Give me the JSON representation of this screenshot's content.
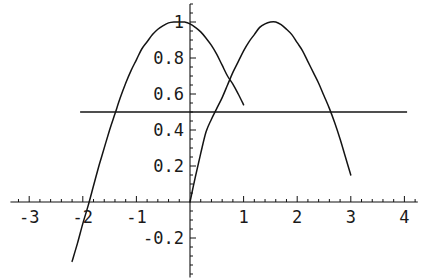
{
  "chart_data": {
    "type": "line",
    "title": "",
    "xlabel": "",
    "ylabel": "",
    "xlim": [
      -3.35,
      4.25
    ],
    "ylim": [
      -0.42,
      1.1
    ],
    "grid": false,
    "legend": "none",
    "axes": {
      "x_axis_value": 0,
      "y_axis_value": 0,
      "x_ticks_major": [
        -3,
        -2,
        -1,
        1,
        2,
        3,
        4
      ],
      "x_tick_labels": [
        "-3",
        "-2",
        "-1",
        "1",
        "2",
        "3",
        "4"
      ],
      "x_ticks_minor_step": 0.2,
      "y_ticks_major": [
        -0.2,
        0.2,
        0.4,
        0.6,
        0.8,
        1
      ],
      "y_tick_labels": [
        "-0.2",
        "0.2",
        "0.4",
        "0.6",
        "0.8",
        "1"
      ],
      "y_ticks_minor_step": 0.05
    },
    "series": [
      {
        "name": "curve-left-peak",
        "description": "cosine-like arc peaking at 1.0 near x=-0.1, drawn from x=-2.2 to x=1.0",
        "x_start": -2.2,
        "x_end": 1.0,
        "peak_x": -0.1,
        "peak_y": 1.0,
        "points": [
          [
            -2.2,
            -0.33
          ],
          [
            -2.1,
            -0.23
          ],
          [
            -2.0,
            -0.12
          ],
          [
            -1.9,
            -0.02
          ],
          [
            -1.8,
            0.09
          ],
          [
            -1.7,
            0.2
          ],
          [
            -1.65,
            0.25
          ],
          [
            -1.5,
            0.4
          ],
          [
            -1.4,
            0.49
          ],
          [
            -1.3,
            0.58
          ],
          [
            -1.2,
            0.66
          ],
          [
            -1.1,
            0.73
          ],
          [
            -1.0,
            0.79
          ],
          [
            -0.9,
            0.85
          ],
          [
            -0.8,
            0.89
          ],
          [
            -0.7,
            0.93
          ],
          [
            -0.6,
            0.96
          ],
          [
            -0.5,
            0.98
          ],
          [
            -0.4,
            0.995
          ],
          [
            -0.3,
            1.0
          ],
          [
            -0.2,
            1.0
          ],
          [
            -0.1,
            1.0
          ],
          [
            0.0,
            0.99
          ],
          [
            0.1,
            0.97
          ],
          [
            0.2,
            0.945
          ],
          [
            0.3,
            0.91
          ],
          [
            0.4,
            0.87
          ],
          [
            0.5,
            0.82
          ],
          [
            0.6,
            0.76
          ],
          [
            0.7,
            0.7
          ],
          [
            0.8,
            0.655
          ],
          [
            0.9,
            0.6
          ],
          [
            1.0,
            0.54
          ]
        ]
      },
      {
        "name": "curve-right-peak",
        "description": "sine-like arc rising from origin, peaking at 1.0 near x=1.5, drawn from x=0 to x=3.0",
        "x_start": 0.0,
        "x_end": 3.0,
        "peak_x": 1.5,
        "peak_y": 1.0,
        "points": [
          [
            0.0,
            0.0
          ],
          [
            0.1,
            0.14
          ],
          [
            0.2,
            0.27
          ],
          [
            0.3,
            0.39
          ],
          [
            0.4,
            0.46
          ],
          [
            0.5,
            0.52
          ],
          [
            0.6,
            0.58
          ],
          [
            0.7,
            0.65
          ],
          [
            0.8,
            0.72
          ],
          [
            0.9,
            0.78
          ],
          [
            1.0,
            0.84
          ],
          [
            1.1,
            0.89
          ],
          [
            1.2,
            0.93
          ],
          [
            1.3,
            0.97
          ],
          [
            1.4,
            0.99
          ],
          [
            1.5,
            1.0
          ],
          [
            1.6,
            1.0
          ],
          [
            1.7,
            0.985
          ],
          [
            1.8,
            0.96
          ],
          [
            1.9,
            0.93
          ],
          [
            2.0,
            0.885
          ],
          [
            2.1,
            0.84
          ],
          [
            2.2,
            0.78
          ],
          [
            2.3,
            0.72
          ],
          [
            2.4,
            0.66
          ],
          [
            2.5,
            0.59
          ],
          [
            2.6,
            0.52
          ],
          [
            2.7,
            0.44
          ],
          [
            2.8,
            0.35
          ],
          [
            2.9,
            0.25
          ],
          [
            3.0,
            0.15
          ]
        ]
      },
      {
        "name": "horizontal-reference-line",
        "description": "constant horizontal line at y = 0.5",
        "constant_y": 0.5,
        "x_start": -2.05,
        "x_end": 4.05
      }
    ],
    "colors": {
      "curve": "#141414",
      "axis": "#111111",
      "background": "#ffffff"
    }
  }
}
